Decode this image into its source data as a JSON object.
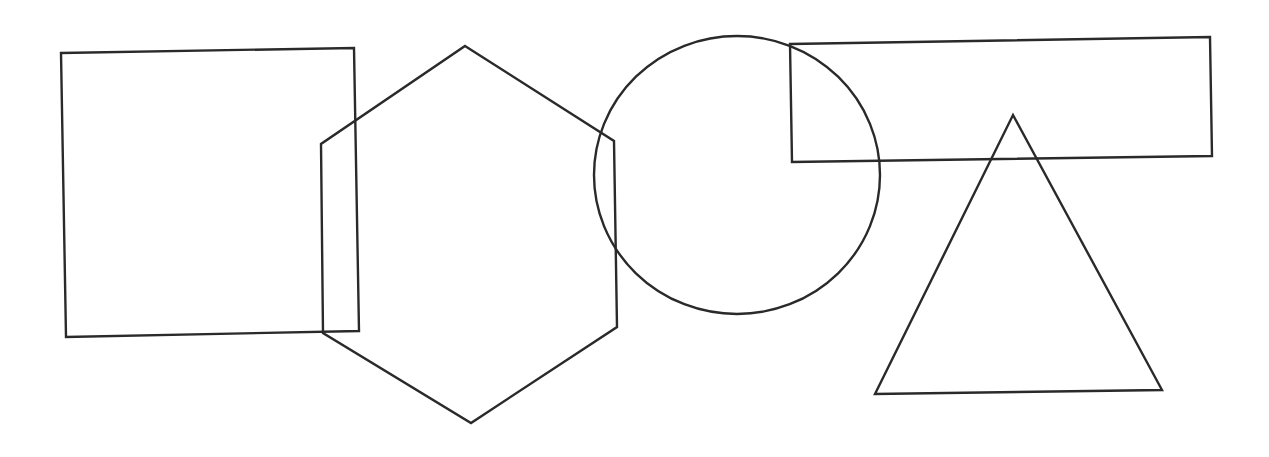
{
  "canvas": {
    "width": 1269,
    "height": 457,
    "background": "#ffffff",
    "stroke_color": "#2a2a2a",
    "stroke_width": 2.4
  },
  "shapes": [
    {
      "id": "square",
      "type": "polygon",
      "points": "61,53 354,48 359,331 66,337"
    },
    {
      "id": "hexagon",
      "type": "polygon",
      "points": "465,46 614,141 617,327 471,423 323,333 321,144"
    },
    {
      "id": "circle",
      "type": "ellipse",
      "cx": 737,
      "cy": 175,
      "rx": 143,
      "ry": 139
    },
    {
      "id": "rectangle",
      "type": "polygon",
      "points": "790,44 1210,37 1212,156 792,162"
    },
    {
      "id": "triangle",
      "type": "polygon",
      "points": "1013,115 1162,390 875,394"
    }
  ]
}
